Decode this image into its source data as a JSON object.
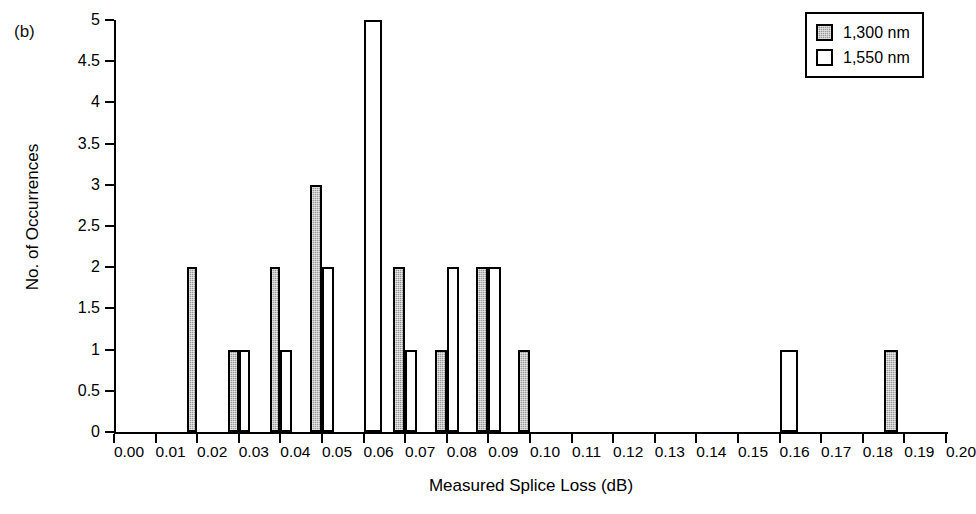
{
  "panel_label": "(b)",
  "chart_data": {
    "type": "bar",
    "title": "",
    "subtitle": "",
    "xlabel": "Measured Splice Loss (dB)",
    "ylabel": "No. of Occurrences",
    "xlim": [
      0.0,
      0.2
    ],
    "ylim": [
      0,
      5
    ],
    "grid": false,
    "legend_position": "top-right",
    "x_tick_labels": [
      "0.00",
      "0.01",
      "0.02",
      "0.03",
      "0.04",
      "0.05",
      "0.06",
      "0.07",
      "0.08",
      "0.09",
      "0.10",
      "0.11",
      "0.12",
      "0.13",
      "0.14",
      "0.15",
      "0.16",
      "0.17",
      "0.18",
      "0.19",
      "0.20"
    ],
    "x_tick_values": [
      0.0,
      0.01,
      0.02,
      0.03,
      0.04,
      0.05,
      0.06,
      0.07,
      0.08,
      0.09,
      0.1,
      0.11,
      0.12,
      0.13,
      0.14,
      0.15,
      0.16,
      0.17,
      0.18,
      0.19,
      0.2
    ],
    "y_tick_labels": [
      "0",
      "0.5",
      "1",
      "1.5",
      "2",
      "2.5",
      "3",
      "3.5",
      "4",
      "4.5",
      "5"
    ],
    "y_tick_values": [
      0,
      0.5,
      1,
      1.5,
      2,
      2.5,
      3,
      3.5,
      4,
      4.5,
      5
    ],
    "series": [
      {
        "name": "1,300 nm",
        "fill": "hatched-gray",
        "color": "#9a9a9a",
        "bars": [
          {
            "x_start": 0.0175,
            "x_end": 0.02,
            "value": 2
          },
          {
            "x_start": 0.0275,
            "x_end": 0.03,
            "value": 1
          },
          {
            "x_start": 0.0375,
            "x_end": 0.04,
            "value": 2
          },
          {
            "x_start": 0.047,
            "x_end": 0.05,
            "value": 3
          },
          {
            "x_start": 0.067,
            "x_end": 0.07,
            "value": 2
          },
          {
            "x_start": 0.0772,
            "x_end": 0.08,
            "value": 1
          },
          {
            "x_start": 0.087,
            "x_end": 0.09,
            "value": 2
          },
          {
            "x_start": 0.097,
            "x_end": 0.1,
            "value": 1
          },
          {
            "x_start": 0.185,
            "x_end": 0.1885,
            "value": 1
          }
        ]
      },
      {
        "name": "1,550 nm",
        "fill": "white",
        "color": "#ffffff",
        "bars": [
          {
            "x_start": 0.03,
            "x_end": 0.0327,
            "value": 1
          },
          {
            "x_start": 0.04,
            "x_end": 0.0428,
            "value": 1
          },
          {
            "x_start": 0.05,
            "x_end": 0.053,
            "value": 2
          },
          {
            "x_start": 0.06,
            "x_end": 0.0645,
            "value": 5
          },
          {
            "x_start": 0.07,
            "x_end": 0.0728,
            "value": 1
          },
          {
            "x_start": 0.08,
            "x_end": 0.083,
            "value": 2
          },
          {
            "x_start": 0.09,
            "x_end": 0.093,
            "value": 2
          },
          {
            "x_start": 0.16,
            "x_end": 0.1645,
            "value": 1
          }
        ]
      }
    ]
  },
  "legend": {
    "entries": [
      {
        "label": "1,300 nm",
        "swatch": "hatched-gray"
      },
      {
        "label": "1,550 nm",
        "swatch": "white"
      }
    ]
  }
}
